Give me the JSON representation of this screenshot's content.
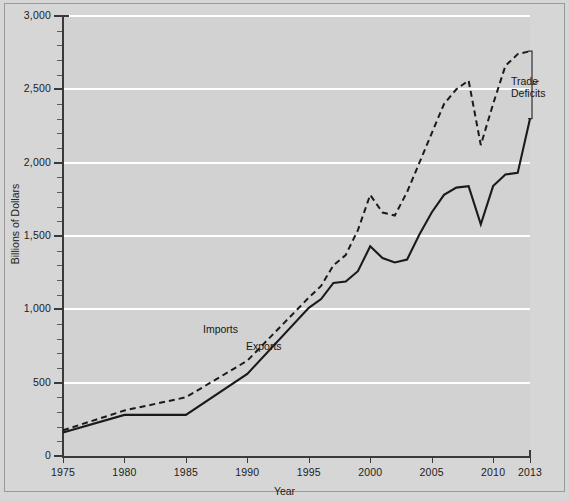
{
  "chart_data": {
    "type": "line",
    "title": "",
    "xlabel": "Year",
    "ylabel": "Billions of Dollars",
    "xlim": [
      1975,
      2013
    ],
    "ylim": [
      0,
      3000
    ],
    "grid": true,
    "legend_position": "inline-annotations",
    "y_ticks": [
      0,
      500,
      1000,
      1500,
      2000,
      2500,
      3000
    ],
    "y_tick_labels": [
      "0",
      "500",
      "1,000",
      "1,500",
      "2,000",
      "2,500",
      "3,000"
    ],
    "y_minor_tick_step": 100,
    "x_ticks": [
      1975,
      1980,
      1985,
      1990,
      1995,
      2000,
      2005,
      2010,
      2013
    ],
    "x_tick_labels": [
      "1975",
      "1980",
      "1985",
      "1990",
      "1995",
      "2000",
      "2005",
      "2010",
      "2013"
    ],
    "annotations": [
      {
        "text": "Imports",
        "series": "Imports"
      },
      {
        "text": "Exports",
        "series": "Exports"
      },
      {
        "text": "Trade\nDeficits",
        "series": "gap-bracket"
      }
    ],
    "x": [
      1975,
      1980,
      1985,
      1990,
      1995,
      1996,
      1997,
      1998,
      1999,
      2000,
      2001,
      2002,
      2003,
      2004,
      2005,
      2006,
      2007,
      2008,
      2009,
      2010,
      2011,
      2012,
      2013
    ],
    "series": [
      {
        "name": "Imports",
        "style": "dashed",
        "color": "#1a1a1a",
        "values": [
          175,
          310,
          400,
          650,
          1080,
          1160,
          1300,
          1370,
          1540,
          1780,
          1660,
          1640,
          1800,
          2000,
          2200,
          2400,
          2500,
          2560,
          2120,
          2400,
          2660,
          2740,
          2760
        ]
      },
      {
        "name": "Exports",
        "style": "solid",
        "color": "#1a1a1a",
        "values": [
          160,
          280,
          280,
          560,
          1010,
          1070,
          1180,
          1190,
          1260,
          1430,
          1350,
          1320,
          1340,
          1510,
          1660,
          1780,
          1830,
          1840,
          1580,
          1840,
          1920,
          1930,
          2300
        ]
      }
    ],
    "trade_deficit_2013": 460
  },
  "colors": {
    "background": "#d6d6d6",
    "plot_background": "#d2d2d2",
    "gridline": "#ffffff",
    "axis": "#3a3a3a",
    "line": "#1a1a1a",
    "text": "#1c1c1c"
  }
}
